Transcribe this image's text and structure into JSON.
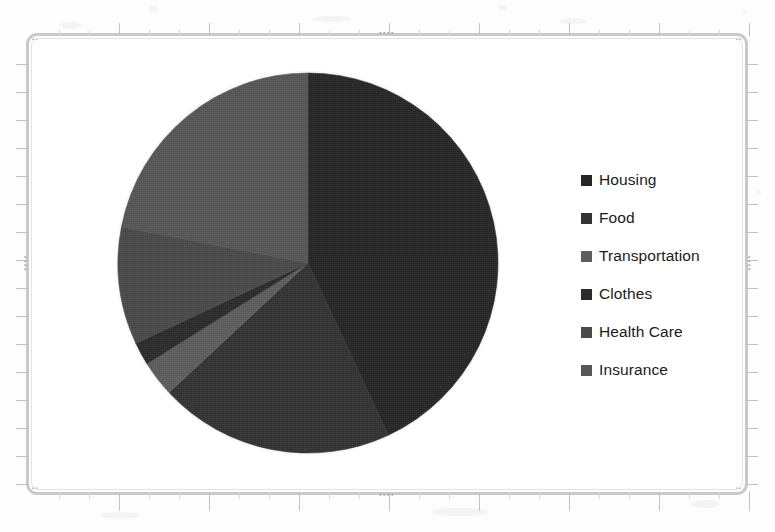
{
  "frame": {
    "handle_glyph": "▪▪▪▪",
    "corner_glyph": "▪▪"
  },
  "legend": {
    "items": [
      {
        "label": "Housing",
        "swatch_name": "legend-swatch-housing",
        "color": "#262626"
      },
      {
        "label": "Food",
        "swatch_name": "legend-swatch-food",
        "color": "#333333"
      },
      {
        "label": "Transportation",
        "swatch_name": "legend-swatch-transportation",
        "color": "#5e5e5e"
      },
      {
        "label": "Clothes",
        "swatch_name": "legend-swatch-clothes",
        "color": "#2b2b2b"
      },
      {
        "label": "Health Care",
        "swatch_name": "legend-swatch-health-care",
        "color": "#4a4a4a"
      },
      {
        "label": "Insurance",
        "swatch_name": "legend-swatch-insurance",
        "color": "#565656"
      }
    ]
  },
  "chart_data": {
    "type": "pie",
    "title": "",
    "subtitle": "",
    "xlabel": "",
    "ylabel": "",
    "grid": false,
    "legend_position": "right",
    "start_angle_deg": 0,
    "direction": "clockwise",
    "categories": [
      "Housing",
      "Food",
      "Transportation",
      "Clothes",
      "Health Care",
      "Insurance"
    ],
    "values": [
      43,
      20,
      3,
      2,
      10,
      22
    ],
    "units": "percent",
    "slices": [
      {
        "label": "Housing",
        "value": 43,
        "color": "#262626",
        "start_deg": 0,
        "end_deg": 155
      },
      {
        "label": "Food",
        "value": 20,
        "color": "#333333",
        "start_deg": 155,
        "end_deg": 227
      },
      {
        "label": "Transportation",
        "value": 3,
        "color": "#5e5e5e",
        "start_deg": 227,
        "end_deg": 238
      },
      {
        "label": "Clothes",
        "value": 2,
        "color": "#2b2b2b",
        "start_deg": 238,
        "end_deg": 245
      },
      {
        "label": "Health Care",
        "value": 10,
        "color": "#4a4a4a",
        "start_deg": 245,
        "end_deg": 281
      },
      {
        "label": "Insurance",
        "value": 22,
        "color": "#565656",
        "start_deg": 281,
        "end_deg": 360
      }
    ]
  }
}
